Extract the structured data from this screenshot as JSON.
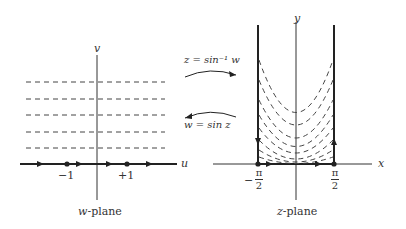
{
  "diagram": {
    "type": "conformal-mapping",
    "w_plane": {
      "caption_var": "w",
      "caption_rest": "-plane",
      "axis_horizontal": "u",
      "axis_vertical": "v",
      "tick_left": "−1",
      "tick_right": "+1",
      "dashed_horizontal_lines": 5
    },
    "z_plane": {
      "caption_var": "z",
      "caption_rest": "-plane",
      "axis_horizontal": "x",
      "axis_vertical": "y",
      "tick_left_sign": "−",
      "tick_left_num": "π",
      "tick_left_den": "2",
      "tick_right_num": "π",
      "tick_right_den": "2",
      "dashed_curves": 8
    },
    "mappings": {
      "forward": "z = sin⁻¹ w",
      "inverse": "w = sin z"
    },
    "colors": {
      "ink": "#222222",
      "dashes": "#444444",
      "background": "#ffffff"
    }
  }
}
